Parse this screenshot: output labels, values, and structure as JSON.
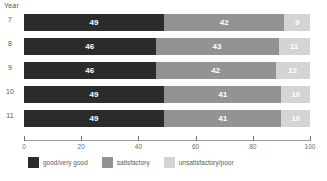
{
  "chart_data": {
    "type": "bar",
    "orientation": "horizontal",
    "stacked": true,
    "title": "",
    "xlabel": "",
    "ylabel": "Year",
    "categories": [
      "7",
      "8",
      "9",
      "10",
      "11"
    ],
    "series": [
      {
        "name": "good/very good",
        "color": "#2b2b2b",
        "values": [
          49,
          46,
          46,
          49,
          49
        ]
      },
      {
        "name": "satisfactory",
        "color": "#939393",
        "values": [
          42,
          43,
          42,
          41,
          41
        ]
      },
      {
        "name": "unsatisfactory/poor",
        "color": "#d4d4d4",
        "values": [
          9,
          11,
          12,
          10,
          10
        ]
      }
    ],
    "xlim": [
      0,
      100
    ],
    "xticks": [
      "0",
      "20",
      "40",
      "60",
      "80",
      "100"
    ],
    "grid": false,
    "legend_position": "bottom",
    "data_labels": true
  },
  "axis": {
    "y_title": "Year",
    "ticks": [
      "0",
      "20",
      "40",
      "60",
      "80",
      "100"
    ]
  },
  "rows": [
    {
      "label": "7",
      "segments": [
        {
          "value": "49"
        },
        {
          "value": "42"
        },
        {
          "value": "9"
        }
      ]
    },
    {
      "label": "8",
      "segments": [
        {
          "value": "46"
        },
        {
          "value": "43"
        },
        {
          "value": "11"
        }
      ]
    },
    {
      "label": "9",
      "segments": [
        {
          "value": "46"
        },
        {
          "value": "42"
        },
        {
          "value": "12"
        }
      ]
    },
    {
      "label": "10",
      "segments": [
        {
          "value": "49"
        },
        {
          "value": "41"
        },
        {
          "value": "10"
        }
      ]
    },
    {
      "label": "11",
      "segments": [
        {
          "value": "49"
        },
        {
          "value": "41"
        },
        {
          "value": "10"
        }
      ]
    }
  ],
  "legend": {
    "items": [
      {
        "label": "good/very good"
      },
      {
        "label": "satisfactory"
      },
      {
        "label": "unsatisfactory/poor"
      }
    ]
  }
}
